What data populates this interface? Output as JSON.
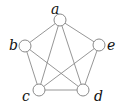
{
  "diagram": {
    "type": "graph",
    "nodes": [
      {
        "id": "a",
        "label": "a",
        "x": 60,
        "y": 20,
        "lx": 51,
        "ly": 14
      },
      {
        "id": "b",
        "label": "b",
        "x": 25,
        "y": 46,
        "lx": 9,
        "ly": 50
      },
      {
        "id": "e",
        "label": "e",
        "x": 99,
        "y": 45,
        "lx": 107,
        "ly": 50
      },
      {
        "id": "c",
        "label": "c",
        "x": 39,
        "y": 90,
        "lx": 22,
        "ly": 101
      },
      {
        "id": "d",
        "label": "d",
        "x": 83,
        "y": 90,
        "lx": 94,
        "ly": 101
      }
    ],
    "edges": [
      [
        "a",
        "b"
      ],
      [
        "a",
        "e"
      ],
      [
        "a",
        "c"
      ],
      [
        "a",
        "d"
      ],
      [
        "b",
        "c"
      ],
      [
        "b",
        "d"
      ],
      [
        "e",
        "c"
      ],
      [
        "e",
        "d"
      ],
      [
        "c",
        "d"
      ]
    ],
    "node_radius": 6,
    "colors": {
      "stroke": "#8a8a8a",
      "node_fill": "#ffffff",
      "label": "#111111"
    }
  }
}
